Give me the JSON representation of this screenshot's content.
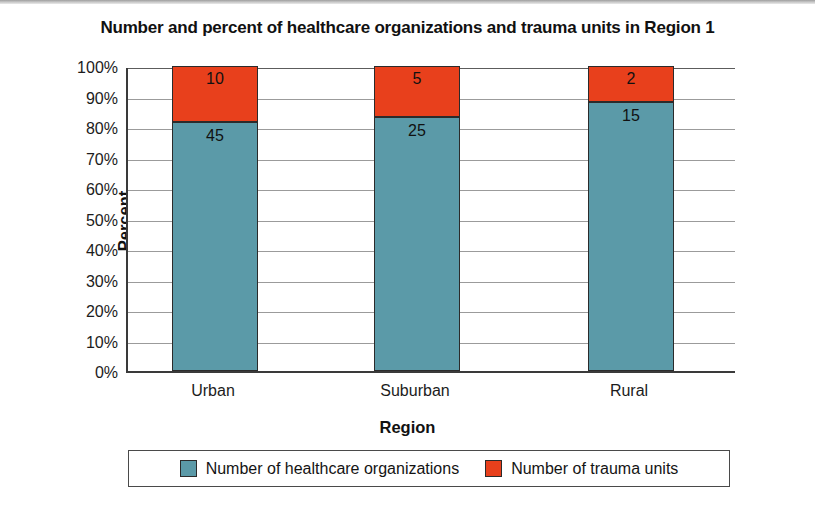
{
  "chart_data": {
    "type": "bar",
    "subtype": "stacked-100-percent",
    "title": "Number and percent of healthcare organizations and trauma units in Region 1",
    "xlabel": "Region",
    "ylabel": "Percent",
    "categories": [
      "Urban",
      "Suburban",
      "Rural"
    ],
    "ylim": [
      0,
      100
    ],
    "ytick_labels": [
      "100%",
      "90%",
      "80%",
      "70%",
      "60%",
      "50%",
      "40%",
      "30%",
      "20%",
      "10%",
      "0%"
    ],
    "ytick_values": [
      100,
      90,
      80,
      70,
      60,
      50,
      40,
      30,
      20,
      10,
      0
    ],
    "grid": true,
    "legend_position": "bottom",
    "series": [
      {
        "name": "Number of healthcare organizations",
        "color": "#5b9aa8",
        "values": [
          45,
          25,
          15
        ],
        "percents": [
          81.8,
          83.3,
          88.2
        ]
      },
      {
        "name": "Number of trauma units",
        "color": "#e8401c",
        "values": [
          10,
          5,
          2
        ],
        "percents": [
          18.2,
          16.7,
          11.8
        ]
      }
    ]
  },
  "colors": {
    "series_teal": "#5b9aa8",
    "series_red": "#e8401c",
    "axis": "#3a3a3a",
    "gridline": "#9b9b9b",
    "text": "#1a1a1a",
    "background": "#ffffff"
  }
}
